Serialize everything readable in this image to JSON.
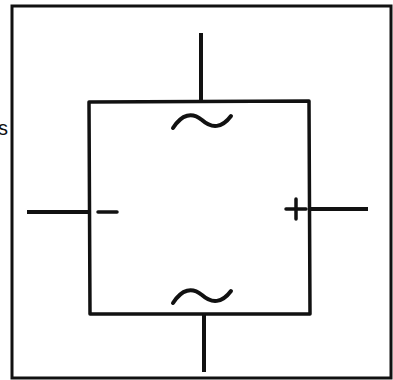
{
  "diagram": {
    "type": "bridge-rectifier-symbol",
    "stroke_color": "#111111",
    "background": "#ffffff",
    "edge_label": "s",
    "terminals": {
      "top": {
        "label": "~",
        "role": "ac-input"
      },
      "bottom": {
        "label": "~",
        "role": "ac-input"
      },
      "left": {
        "label": "−",
        "role": "dc-negative"
      },
      "right": {
        "label": "+",
        "role": "dc-positive"
      }
    }
  }
}
